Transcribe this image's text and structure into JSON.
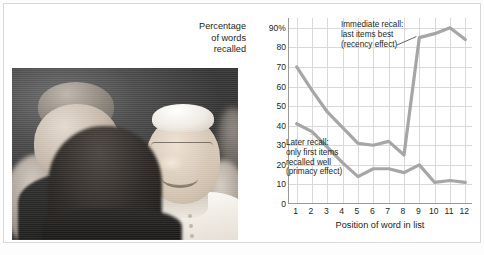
{
  "figure": {
    "photo_credit": "Vincenzo Pinto/AFP/Getty Images",
    "photo_alt": "photograph of a smiling man in white vestments greeting a crowd"
  },
  "chart_data": {
    "type": "line",
    "title": "",
    "xlabel": "Position of word in list",
    "ylabel": "Percentage of words recalled",
    "ylabel_lines": [
      "Percentage",
      "of words",
      "recalled"
    ],
    "x": [
      1,
      2,
      3,
      4,
      5,
      6,
      7,
      8,
      9,
      10,
      11,
      12
    ],
    "xticklabels": [
      "1",
      "2",
      "3",
      "4",
      "5",
      "6",
      "7",
      "8",
      "9",
      "10",
      "11",
      "12"
    ],
    "yticks": [
      0,
      10,
      20,
      30,
      40,
      50,
      60,
      70,
      80,
      90
    ],
    "yticklabels": [
      "0",
      "10",
      "20",
      "30",
      "40",
      "50",
      "60",
      "70",
      "80",
      "90%"
    ],
    "ylim": [
      0,
      95
    ],
    "xlim": [
      0.5,
      12.5
    ],
    "grid": true,
    "legend": "none",
    "line_color": "#a6a6a6",
    "grid_color": "#d9d9d9",
    "axis_color": "#9a9a9a",
    "series": [
      {
        "name": "Immediate recall",
        "values": [
          70,
          58,
          47,
          39,
          31,
          30,
          32,
          25,
          85,
          87,
          90,
          84
        ]
      },
      {
        "name": "Later recall",
        "values": [
          41,
          37,
          29,
          21,
          14,
          18,
          18,
          16,
          20,
          11,
          12,
          11
        ]
      }
    ],
    "annotations": [
      {
        "id": "immediate",
        "lines": [
          "Immediate recall:",
          "last items best",
          "(recency effect)"
        ],
        "points_to": "series 1 near x=9"
      },
      {
        "id": "later",
        "lines": [
          "Later recall:",
          "only first items",
          "recalled well",
          "(primacy effect)"
        ],
        "points_to": "series 2 near x=2"
      }
    ]
  }
}
